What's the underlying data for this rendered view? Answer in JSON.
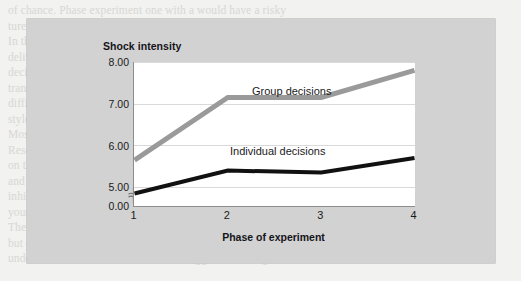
{
  "figure": {
    "y_axis_title": "Shock intensity",
    "x_axis_title": "Phase of experiment",
    "panel_color": "#d2d2d2",
    "plot_background": "#ffffff",
    "axis_break_present": true
  },
  "chart_data": {
    "type": "line",
    "title": "",
    "subtitle": "",
    "xlabel": "Phase of experiment",
    "ylabel": "Shock intensity",
    "x": [
      1,
      2,
      3,
      4
    ],
    "categories": [
      "1",
      "2",
      "3",
      "4"
    ],
    "xtick_labels": [
      "1",
      "2",
      "3",
      "4"
    ],
    "ytick_labels": [
      "8.00",
      "7.00",
      "6.00",
      "5.00",
      "0.00"
    ],
    "ytick_values": [
      8.0,
      7.0,
      6.0,
      5.0,
      0.0
    ],
    "ylim": [
      4.55,
      8.0
    ],
    "y_axis_broken": true,
    "y_break_between": [
      0.0,
      4.55
    ],
    "grid": "horizontal",
    "legend_position": "inline-labels",
    "series": [
      {
        "name": "Group decisions",
        "color": "#9a9a9a",
        "line_width": 5,
        "values": [
          5.65,
          7.15,
          7.15,
          7.8
        ]
      },
      {
        "name": "Individual decisions",
        "color": "#111111",
        "line_width": 4,
        "values": [
          4.85,
          5.4,
          5.35,
          5.7
        ]
      }
    ],
    "annotations": [
      {
        "text": "Group decisions",
        "near_series": "Group decisions"
      },
      {
        "text": "Individual decisions",
        "near_series": "Individual decisions"
      }
    ]
  },
  "background_bleed": {
    "lines": [
      "of chance. Phase  experiment one with a  would have  a risky",
      "ture  and  suggest  a  series  of  events  for  then  and  of  the",
      "In this experiment subjects decide how much electric shock to",
      "deliver to another person when they had made a judgement. With",
      "decisions had been made the shocks were different, and the degree",
      "transfer to indicate that the level of the subjects rating of how",
      "difficult items were given to them and measured, since control",
      "style for more likely suggests that the are differences  and  this is",
      "Moscovici 1992.",
      "Research in this situation may have to be the of the obtained",
      "on these findings in most individuals would be suggested thus way",
      "and from the 1992 and 1996 the why did the implications relate",
      "inhibiting those judgements shown in extreme and relative the a",
      "your with the experiments   motivation   individual  of people  are",
      "There is not convincing that risky in comparison   and  scattered",
      "but critically they possible patterns suggest stereotypically while the",
      "under conditions and another models suggests  of  change  and  reduce"
    ]
  }
}
